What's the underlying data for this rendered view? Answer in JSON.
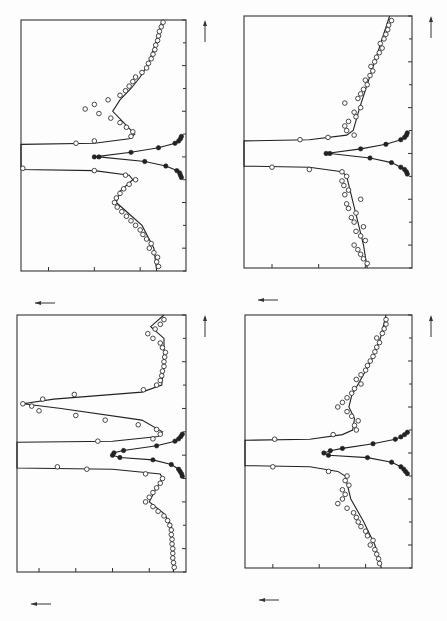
{
  "figure": {
    "orientation": "rotated 90deg counterclockwise (energy axis vertical, counts axis horizontal)",
    "x_axis_label": "energy transfer (THz)",
    "y_axis_label": "counts / 13 min"
  },
  "chart_data": [
    {
      "type": "scatter",
      "panel": "top-right-of-page (top-left position)",
      "title": "argon-CH4 (16%)",
      "legend": [
        "argon-CH₄ (16%)",
        "T = 12.5 K",
        "Q = 2.26 Å⁻¹"
      ],
      "xlabel": "energy transfer (THz)",
      "ylabel": "counts / 13 min",
      "xlim": [
        -0.5,
        0.6
      ],
      "ylim": [
        0,
        180
      ],
      "xticks": [
        "-0.4",
        "-0.2",
        "0.0",
        "0.2",
        "0.4",
        "0.6"
      ],
      "yticks": [
        "50",
        "100",
        "150"
      ],
      "series": [
        {
          "name": "sample (open circles)",
          "marker": "open",
          "x": [
            -0.48,
            -0.46,
            -0.44,
            -0.42,
            -0.4,
            -0.38,
            -0.36,
            -0.34,
            -0.32,
            -0.3,
            -0.28,
            -0.26,
            -0.24,
            -0.22,
            -0.2,
            -0.18,
            -0.16,
            -0.14,
            -0.12,
            -0.1,
            -0.08,
            -0.06,
            -0.05,
            0.06,
            0.07,
            0.09,
            0.11,
            0.13,
            0.15,
            0.17,
            0.19,
            0.21,
            0.23,
            0.25,
            0.27,
            0.29,
            0.31,
            0.33,
            0.35,
            0.37,
            0.39,
            0.41,
            0.43,
            0.45,
            0.47,
            0.49,
            0.51,
            0.53,
            0.55,
            0.57,
            0.59
          ],
          "y": [
            30,
            32,
            31,
            35,
            40,
            38,
            43,
            47,
            50,
            55,
            60,
            65,
            70,
            75,
            78,
            76,
            72,
            68,
            62,
            55,
            66,
            100,
            178,
            120,
            100,
            60,
            58,
            65,
            72,
            82,
            95,
            110,
            100,
            85,
            72,
            66,
            62,
            58,
            55,
            48,
            43,
            41,
            38,
            36,
            34,
            33,
            31,
            30,
            29,
            27,
            25
          ]
        },
        {
          "name": "fit (solid line)",
          "marker": "line",
          "x": [
            -0.5,
            -0.4,
            -0.3,
            -0.25,
            -0.2,
            -0.15,
            -0.1,
            -0.08,
            -0.06,
            -0.055,
            0.055,
            0.06,
            0.08,
            0.1,
            0.15,
            0.2,
            0.25,
            0.3,
            0.35,
            0.4,
            0.5,
            0.6
          ],
          "y": [
            32,
            35,
            48,
            62,
            76,
            72,
            58,
            62,
            100,
            180,
            180,
            100,
            62,
            56,
            68,
            80,
            72,
            60,
            50,
            42,
            33,
            26
          ]
        },
        {
          "name": "resolution (filled circles)",
          "marker": "filled",
          "x": [
            -0.09,
            -0.08,
            -0.07,
            -0.06,
            -0.04,
            -0.02,
            0.0,
            0.0,
            0.02,
            0.04,
            0.06,
            0.07,
            0.08,
            0.09
          ],
          "y": [
            5,
            6,
            7,
            10,
            22,
            45,
            95,
            100,
            60,
            30,
            12,
            8,
            6,
            5
          ]
        }
      ]
    },
    {
      "type": "scatter",
      "panel": "bottom-left position",
      "title": "argon-CH4 (16%)",
      "legend": [
        "argon-CH₄ (16%)",
        "T = 4.75 K",
        "Q = 2.26 Å⁻¹"
      ],
      "xlabel": "energy transfer (THz)",
      "ylabel": "counts / 13 min",
      "xlim": [
        -0.5,
        0.6
      ],
      "ylim": [
        0,
        230
      ],
      "xticks": [
        "-0.4",
        "-0.2",
        "0.0",
        "0.2",
        "0.4",
        "0.6"
      ],
      "yticks": [
        "50",
        "100",
        "150",
        "200"
      ],
      "series": [
        {
          "name": "sample (open circles)",
          "marker": "open",
          "x": [
            -0.48,
            -0.46,
            -0.44,
            -0.42,
            -0.4,
            -0.38,
            -0.36,
            -0.34,
            -0.32,
            -0.3,
            -0.28,
            -0.26,
            -0.24,
            -0.22,
            -0.2,
            -0.18,
            -0.16,
            -0.14,
            -0.12,
            -0.1,
            -0.08,
            -0.06,
            -0.05,
            0.06,
            0.07,
            0.09,
            0.11,
            0.13,
            0.15,
            0.17,
            0.19,
            0.21,
            0.22,
            0.24,
            0.26,
            0.28,
            0.3,
            0.32,
            0.34,
            0.36,
            0.38,
            0.4,
            0.42,
            0.44,
            0.46,
            0.48,
            0.5,
            0.52,
            0.54,
            0.56,
            0.58
          ],
          "y": [
            16,
            17,
            18,
            18,
            18,
            19,
            19,
            20,
            20,
            22,
            25,
            30,
            38,
            45,
            55,
            50,
            45,
            40,
            35,
            32,
            55,
            135,
            175,
            120,
            45,
            35,
            40,
            65,
            110,
            150,
            200,
            210,
            222,
            195,
            152,
            58,
            40,
            35,
            33,
            32,
            30,
            30,
            29,
            28,
            32,
            35,
            45,
            52,
            42,
            35,
            30
          ]
        },
        {
          "name": "fit (solid line)",
          "marker": "line",
          "x": [
            -0.5,
            -0.4,
            -0.3,
            -0.25,
            -0.2,
            -0.15,
            -0.1,
            -0.08,
            -0.06,
            -0.055,
            0.055,
            0.06,
            0.08,
            0.1,
            0.15,
            0.2,
            0.22,
            0.24,
            0.27,
            0.3,
            0.4,
            0.5,
            0.55,
            0.6
          ],
          "y": [
            17,
            18,
            20,
            30,
            50,
            42,
            32,
            35,
            100,
            230,
            230,
            100,
            38,
            32,
            60,
            170,
            222,
            180,
            60,
            33,
            30,
            30,
            48,
            30
          ]
        },
        {
          "name": "resolution (filled circles)",
          "marker": "filled",
          "x": [
            -0.09,
            -0.08,
            -0.07,
            -0.06,
            -0.04,
            -0.02,
            -0.01,
            0.0,
            0.01,
            0.02,
            0.04,
            0.06,
            0.07,
            0.08,
            0.09
          ],
          "y": [
            5,
            6,
            8,
            10,
            20,
            45,
            90,
            100,
            98,
            85,
            40,
            15,
            10,
            7,
            5
          ]
        }
      ]
    },
    {
      "type": "scatter",
      "panel": "top-right position",
      "title": "argon-CH4 (16%)",
      "legend": [
        "argon-CH₄ (16%)",
        "T = 30 K",
        "Q = 2.26 Å⁻¹"
      ],
      "xlabel": "energy transfer (THz)",
      "ylabel": "counts / 13 min",
      "xlim": [
        -0.5,
        0.6
      ],
      "ylim": [
        0,
        180
      ],
      "xticks": [
        "-0.4",
        "-0.2",
        "0.0",
        "0.2",
        "0.4",
        "0.6"
      ],
      "yticks": [
        "50",
        "100",
        "150"
      ],
      "series": [
        {
          "name": "sample (open circles)",
          "marker": "open",
          "x": [
            -0.48,
            -0.46,
            -0.44,
            -0.42,
            -0.4,
            -0.38,
            -0.36,
            -0.34,
            -0.32,
            -0.3,
            -0.28,
            -0.26,
            -0.24,
            -0.22,
            -0.2,
            -0.18,
            -0.16,
            -0.14,
            -0.12,
            -0.1,
            -0.08,
            -0.07,
            -0.06,
            0.06,
            0.07,
            0.08,
            0.1,
            0.12,
            0.14,
            0.16,
            0.18,
            0.2,
            0.22,
            0.24,
            0.26,
            0.28,
            0.3,
            0.32,
            0.34,
            0.36,
            0.38,
            0.4,
            0.42,
            0.44,
            0.46,
            0.48,
            0.5,
            0.52,
            0.54,
            0.56,
            0.58
          ],
          "y": [
            48,
            52,
            55,
            58,
            62,
            50,
            55,
            60,
            52,
            62,
            65,
            60,
            68,
            70,
            55,
            72,
            68,
            73,
            75,
            70,
            75,
            110,
            150,
            120,
            90,
            62,
            70,
            72,
            68,
            60,
            62,
            55,
            72,
            58,
            55,
            52,
            48,
            50,
            45,
            42,
            44,
            40,
            38,
            35,
            32,
            34,
            30,
            28,
            26,
            25,
            22
          ]
        },
        {
          "name": "fit (solid line)",
          "marker": "line",
          "x": [
            -0.5,
            -0.4,
            -0.3,
            -0.2,
            -0.1,
            -0.08,
            -0.06,
            -0.055,
            0.055,
            0.06,
            0.08,
            0.1,
            0.2,
            0.3,
            0.4,
            0.5,
            0.6
          ],
          "y": [
            48,
            52,
            58,
            64,
            70,
            75,
            110,
            180,
            180,
            110,
            70,
            63,
            56,
            48,
            40,
            32,
            24
          ]
        },
        {
          "name": "resolution (filled circles)",
          "marker": "filled",
          "x": [
            -0.09,
            -0.08,
            -0.07,
            -0.06,
            -0.04,
            -0.02,
            0.0,
            0.0,
            0.02,
            0.04,
            0.06,
            0.07,
            0.08,
            0.09
          ],
          "y": [
            5,
            6,
            8,
            12,
            22,
            45,
            88,
            92,
            55,
            28,
            12,
            8,
            6,
            5
          ]
        }
      ]
    },
    {
      "type": "scatter",
      "panel": "bottom-right position",
      "title": "argon-CH4 (16%)",
      "legend": [
        "argon-CH₄ (16%)",
        "T = 17.5 K",
        "Q = 2.26 Å⁻¹"
      ],
      "xlabel": "energy transfer (THz)",
      "ylabel": "counts / 13 min",
      "xlim": [
        -0.5,
        0.6
      ],
      "ylim": [
        0,
        180
      ],
      "xticks": [
        "-0.4",
        "-0.2",
        "0.0",
        "0.2",
        "0.4",
        "0.6"
      ],
      "yticks": [
        "50",
        "100",
        "150"
      ],
      "series": [
        {
          "name": "sample (open circles)",
          "marker": "open",
          "x": [
            -0.48,
            -0.46,
            -0.44,
            -0.42,
            -0.4,
            -0.38,
            -0.36,
            -0.34,
            -0.32,
            -0.3,
            -0.28,
            -0.26,
            -0.24,
            -0.22,
            -0.2,
            -0.18,
            -0.16,
            -0.14,
            -0.12,
            -0.1,
            -0.08,
            -0.06,
            0.06,
            0.08,
            0.1,
            0.12,
            0.14,
            0.16,
            0.18,
            0.2,
            0.22,
            0.24,
            0.26,
            0.28,
            0.3,
            0.32,
            0.34,
            0.36,
            0.38,
            0.4,
            0.42,
            0.44,
            0.46,
            0.48,
            0.5,
            0.52,
            0.54,
            0.56,
            0.58
          ],
          "y": [
            35,
            36,
            38,
            40,
            45,
            42,
            48,
            50,
            55,
            58,
            60,
            63,
            70,
            80,
            75,
            72,
            75,
            68,
            72,
            70,
            90,
            150,
            148,
            85,
            60,
            62,
            58,
            65,
            70,
            80,
            75,
            70,
            65,
            62,
            55,
            60,
            55,
            50,
            48,
            45,
            42,
            40,
            38,
            35,
            38,
            32,
            30,
            28,
            28
          ]
        },
        {
          "name": "fit (solid line)",
          "marker": "line",
          "x": [
            -0.5,
            -0.4,
            -0.3,
            -0.2,
            -0.1,
            -0.08,
            -0.06,
            -0.055,
            0.055,
            0.06,
            0.08,
            0.1,
            0.15,
            0.2,
            0.25,
            0.3,
            0.4,
            0.5,
            0.6
          ],
          "y": [
            33,
            40,
            52,
            66,
            72,
            80,
            110,
            180,
            180,
            110,
            75,
            64,
            62,
            68,
            65,
            58,
            44,
            34,
            28
          ]
        },
        {
          "name": "resolution (filled circles)",
          "marker": "filled",
          "x": [
            -0.09,
            -0.08,
            -0.07,
            -0.06,
            -0.04,
            -0.02,
            -0.01,
            0.0,
            0.01,
            0.02,
            0.04,
            0.06,
            0.07,
            0.08,
            0.09
          ],
          "y": [
            5,
            7,
            9,
            12,
            22,
            48,
            90,
            95,
            88,
            75,
            42,
            18,
            12,
            8,
            5
          ]
        }
      ]
    }
  ],
  "panels_layout": [
    {
      "left": 21,
      "top": 20,
      "right": 186,
      "bottom": 271
    },
    {
      "left": 17,
      "top": 315,
      "right": 186,
      "bottom": 572
    },
    {
      "left": 244,
      "top": 16,
      "right": 412,
      "bottom": 268
    },
    {
      "left": 245,
      "top": 315,
      "right": 412,
      "bottom": 568
    }
  ]
}
